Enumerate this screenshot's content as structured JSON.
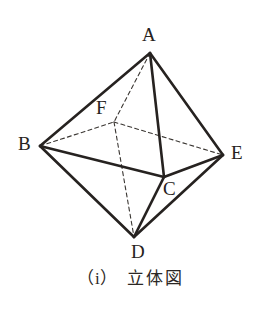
{
  "figure": {
    "name": "octahedron-solid-figure",
    "caption_index": "（i）",
    "caption_text": "立体図",
    "background_color": "#ffffff",
    "stroke_color": "#262220",
    "label_color": "#262220",
    "vertices": [
      {
        "label": "A",
        "x": 150,
        "y": 53,
        "label_x": 142,
        "label_y": 25
      },
      {
        "label": "B",
        "x": 40,
        "y": 146,
        "label_x": 18,
        "label_y": 134
      },
      {
        "label": "C",
        "x": 164,
        "y": 177,
        "label_x": 163,
        "label_y": 179
      },
      {
        "label": "D",
        "x": 134,
        "y": 237,
        "label_x": 131,
        "label_y": 242
      },
      {
        "label": "E",
        "x": 223,
        "y": 155,
        "label_x": 231,
        "label_y": 143
      },
      {
        "label": "F",
        "x": 114,
        "y": 122,
        "label_x": 96,
        "label_y": 98
      }
    ],
    "edges_solid": [
      {
        "from": "A",
        "to": "B"
      },
      {
        "from": "A",
        "to": "E"
      },
      {
        "from": "A",
        "to": "C"
      },
      {
        "from": "B",
        "to": "C"
      },
      {
        "from": "C",
        "to": "E"
      },
      {
        "from": "B",
        "to": "D"
      },
      {
        "from": "D",
        "to": "E"
      },
      {
        "from": "C",
        "to": "D"
      }
    ],
    "edges_dashed": [
      {
        "from": "A",
        "to": "F"
      },
      {
        "from": "B",
        "to": "F"
      },
      {
        "from": "F",
        "to": "E"
      },
      {
        "from": "F",
        "to": "D"
      }
    ]
  }
}
